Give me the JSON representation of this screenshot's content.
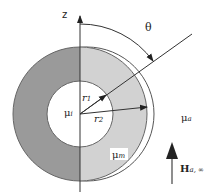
{
  "diagram": {
    "axis_label": "z",
    "angle_label": "θ",
    "inner_radius_label": {
      "base": "r",
      "sub": "1"
    },
    "outer_radius_label": {
      "base": "r",
      "sub": "2"
    },
    "inner_region_label": {
      "base": "μ",
      "sub": "i"
    },
    "shell_region_label": {
      "base": "μ",
      "sub": "m"
    },
    "outer_region_label": {
      "base": "μ",
      "sub": "a"
    },
    "field_label": {
      "base": "H",
      "sub": "a, ∞"
    },
    "colors": {
      "shell_dark": "#9a9a9a",
      "shell_light": "#d2d2d2",
      "lines": "#333333",
      "background": "#ffffff"
    }
  }
}
